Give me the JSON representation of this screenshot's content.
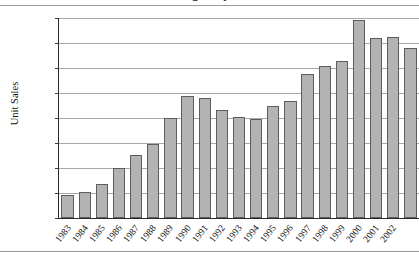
{
  "chart_data": {
    "type": "bar",
    "title": "U.S. Sales of Widgets by Year, 1983–2002",
    "xlabel": "",
    "ylabel": "Unit Sales",
    "ylim": [
      0,
      40000
    ],
    "ytick_interval": 5000,
    "ytick_labels": [
      "40,000",
      "35,000",
      "30,000",
      "25,000",
      "20,000",
      "15,000",
      "10,000",
      "5,000",
      "0"
    ],
    "ytick_values": [
      40000,
      35000,
      30000,
      25000,
      20000,
      15000,
      10000,
      5000,
      0
    ],
    "grid": true,
    "legend": false,
    "bar_color": "#b3b3b3",
    "bar_border_color": "#5d5d5d",
    "categories": [
      "1983",
      "1984",
      "1985",
      "1986",
      "1987",
      "1988",
      "1989",
      "1990",
      "1991",
      "1992",
      "1993",
      "1994",
      "1995",
      "1996",
      "1997",
      "1998",
      "1999",
      "2000",
      "2001",
      "2002"
    ],
    "values": [
      4700,
      5200,
      6900,
      10000,
      12600,
      14900,
      20000,
      24500,
      24100,
      21600,
      20300,
      19900,
      22500,
      23400,
      28900,
      30500,
      31500,
      39700,
      36000,
      36300
    ]
  },
  "extra_bar": {
    "category": "2002",
    "value": 34000
  }
}
